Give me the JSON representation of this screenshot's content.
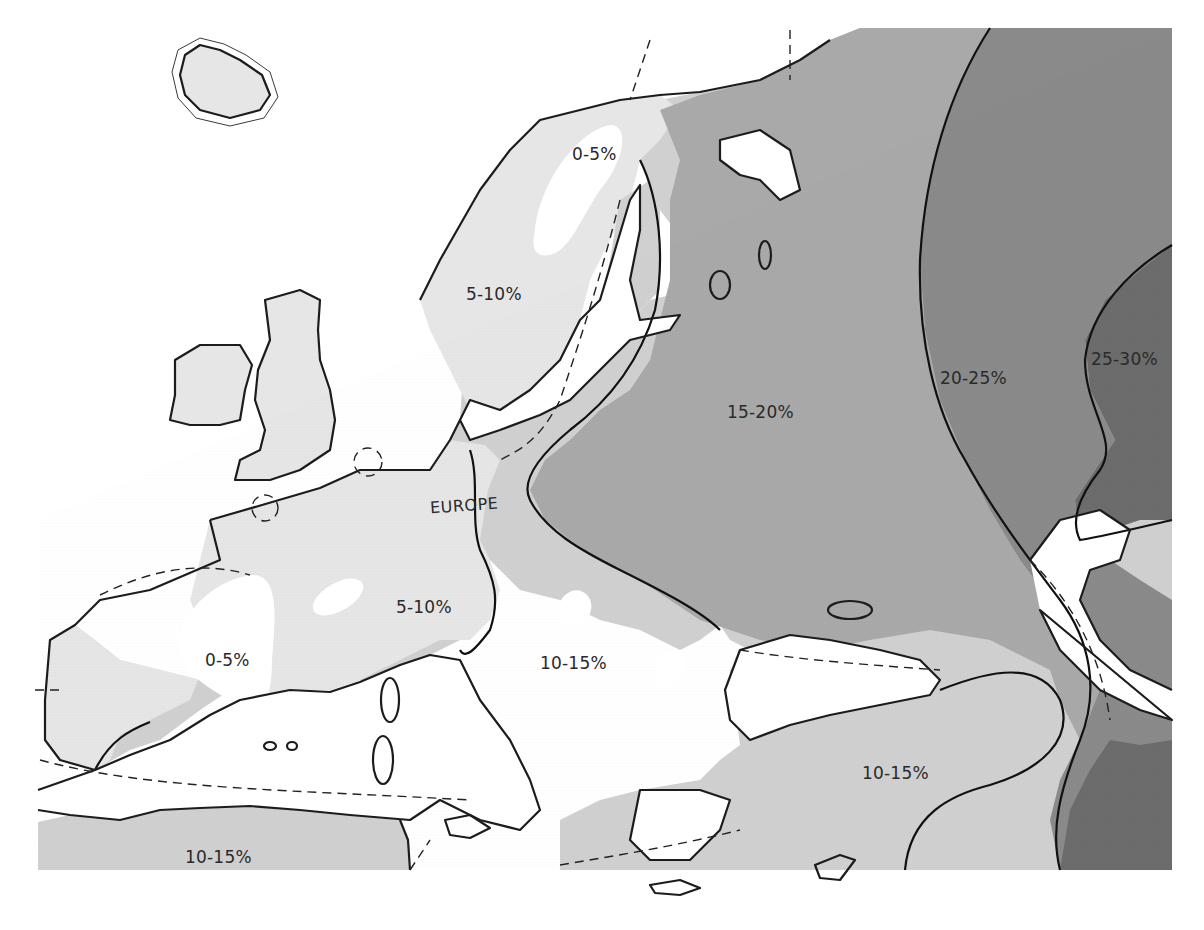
{
  "map": {
    "title": "",
    "region_label": "EUROPE",
    "legend_note": "Shading darkens with higher percentage",
    "zones": [
      {
        "id": "z0",
        "range": "0-5%",
        "fill": "#ffffff"
      },
      {
        "id": "z1",
        "range": "5-10%",
        "fill": "#e6e6e6"
      },
      {
        "id": "z2",
        "range": "10-15%",
        "fill": "#d0d0d0"
      },
      {
        "id": "z3",
        "range": "15-20%",
        "fill": "#a9a9a9"
      },
      {
        "id": "z4",
        "range": "20-25%",
        "fill": "#8a8a8a"
      },
      {
        "id": "z5",
        "range": "25-30%",
        "fill": "#6c6c6c"
      }
    ],
    "labels": {
      "scandinavia_0_5": "0-5%",
      "scandinavia_5_10": "5-10%",
      "west_europe_5_10": "5-10%",
      "iberia_0_5": "0-5%",
      "balkans_10_15": "10-15%",
      "russia_15_20": "15-20%",
      "east_20_25": "20-25%",
      "far_east_25_30": "25-30%",
      "anatolia_10_15": "10-15%",
      "north_africa_10_15": "10-15%"
    },
    "colors": {
      "sea": "#ffffff",
      "coastline": "#1c1c1c",
      "boundary": "#111111",
      "text": "#2a2a2a"
    }
  }
}
